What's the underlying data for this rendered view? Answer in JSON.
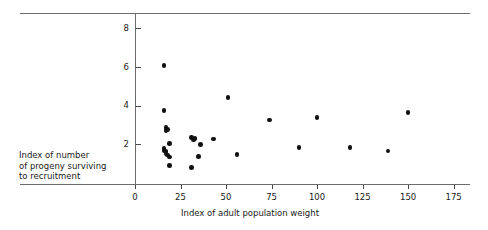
{
  "chart_data": {
    "type": "scatter",
    "title": "",
    "xlabel": "Index of adult population weight",
    "ylabel": "Index of number of progeny surviving to recruitment",
    "ylabel_lines": [
      "Index of number",
      "of progeny surviving",
      "to recruitment"
    ],
    "xlim": [
      0,
      184
    ],
    "ylim": [
      0,
      8.8
    ],
    "xticks": [
      0,
      25,
      50,
      75,
      100,
      125,
      150,
      175
    ],
    "xticklabels": [
      "0",
      "25",
      "50",
      "75",
      "100",
      "125",
      "150",
      "175"
    ],
    "yticks": [
      2,
      4,
      6,
      8
    ],
    "yticklabels": [
      "2",
      "4",
      "6",
      "8"
    ],
    "grid": false,
    "legend": null,
    "marker": "filled-circle",
    "marker_color": "#111111",
    "axis_color": "#6b6b6b",
    "points": [
      {
        "x": 16,
        "y": 6.08
      },
      {
        "x": 16,
        "y": 3.76
      },
      {
        "x": 17,
        "y": 2.86
      },
      {
        "x": 17,
        "y": 2.72
      },
      {
        "x": 18,
        "y": 2.76
      },
      {
        "x": 19,
        "y": 2.04
      },
      {
        "x": 16,
        "y": 1.78
      },
      {
        "x": 16,
        "y": 1.66
      },
      {
        "x": 17,
        "y": 1.62
      },
      {
        "x": 17,
        "y": 1.5
      },
      {
        "x": 18,
        "y": 1.44
      },
      {
        "x": 19,
        "y": 1.34
      },
      {
        "x": 19,
        "y": 0.9
      },
      {
        "x": 31,
        "y": 2.36
      },
      {
        "x": 32,
        "y": 2.24
      },
      {
        "x": 33,
        "y": 2.3
      },
      {
        "x": 36,
        "y": 1.98
      },
      {
        "x": 35,
        "y": 1.36
      },
      {
        "x": 31,
        "y": 0.8
      },
      {
        "x": 43,
        "y": 2.28
      },
      {
        "x": 51,
        "y": 4.42
      },
      {
        "x": 56,
        "y": 1.48
      },
      {
        "x": 74,
        "y": 3.26
      },
      {
        "x": 90,
        "y": 1.84
      },
      {
        "x": 100,
        "y": 3.38
      },
      {
        "x": 118,
        "y": 1.84
      },
      {
        "x": 139,
        "y": 1.66
      },
      {
        "x": 150,
        "y": 3.64
      }
    ]
  }
}
